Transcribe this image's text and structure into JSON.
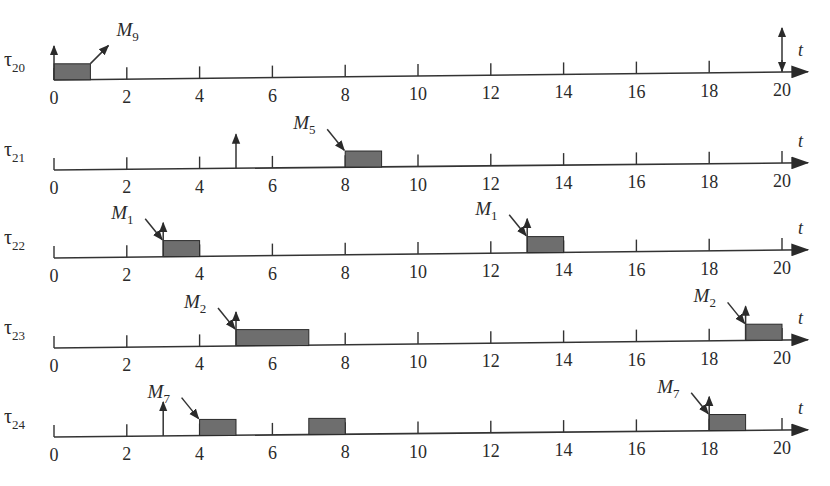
{
  "diagram": {
    "type": "timing-diagram",
    "time_axis": {
      "label": "t",
      "min": 0,
      "max": 20,
      "tick_step": 2,
      "tick_labels": [
        "0",
        "2",
        "4",
        "6",
        "8",
        "10",
        "12",
        "14",
        "16",
        "18",
        "20"
      ]
    },
    "colors": {
      "line": "#333333",
      "block_fill": "#6e6e6e",
      "block_stroke": "#2a2a2a",
      "text": "#2a2a2a"
    },
    "rows": [
      {
        "task": "τ",
        "task_sub": "20",
        "blocks": [
          {
            "start": 0,
            "end": 1
          }
        ],
        "release_arrows": [
          0
        ],
        "deadline_arrows": [
          20
        ],
        "messages": [
          {
            "label": "M",
            "sub": "9",
            "at": 1,
            "direction": "out"
          }
        ]
      },
      {
        "task": "τ",
        "task_sub": "21",
        "blocks": [
          {
            "start": 8,
            "end": 9
          }
        ],
        "release_arrows": [
          5
        ],
        "deadline_arrows": [],
        "messages": [
          {
            "label": "M",
            "sub": "5",
            "at": 8,
            "direction": "in"
          }
        ]
      },
      {
        "task": "τ",
        "task_sub": "22",
        "blocks": [
          {
            "start": 3,
            "end": 4
          },
          {
            "start": 13,
            "end": 14
          }
        ],
        "release_arrows": [
          3,
          13
        ],
        "deadline_arrows": [],
        "messages": [
          {
            "label": "M",
            "sub": "1",
            "at": 3,
            "direction": "in"
          },
          {
            "label": "M",
            "sub": "1",
            "at": 13,
            "direction": "in"
          }
        ]
      },
      {
        "task": "τ",
        "task_sub": "23",
        "blocks": [
          {
            "start": 5,
            "end": 7
          },
          {
            "start": 19,
            "end": 20
          }
        ],
        "release_arrows": [
          5,
          19
        ],
        "deadline_arrows": [],
        "messages": [
          {
            "label": "M",
            "sub": "2",
            "at": 5,
            "direction": "in"
          },
          {
            "label": "M",
            "sub": "2",
            "at": 19,
            "direction": "in"
          }
        ]
      },
      {
        "task": "τ",
        "task_sub": "24",
        "blocks": [
          {
            "start": 4,
            "end": 5
          },
          {
            "start": 7,
            "end": 8
          },
          {
            "start": 18,
            "end": 19
          }
        ],
        "release_arrows": [
          3,
          18
        ],
        "deadline_arrows": [],
        "messages": [
          {
            "label": "M",
            "sub": "7",
            "at": 4,
            "direction": "in"
          },
          {
            "label": "M",
            "sub": "7",
            "at": 18,
            "direction": "in"
          }
        ]
      }
    ]
  }
}
